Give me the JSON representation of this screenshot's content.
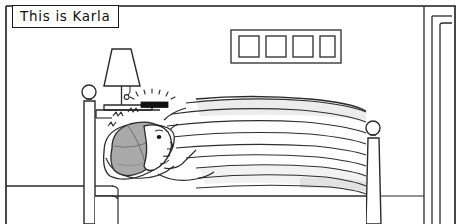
{
  "panel": {
    "caption": "This is Karla",
    "width": 461,
    "height": 224,
    "background_color": "#ffffff",
    "ink_color": "#1a1a1a",
    "style": "black-and-white line-art comic panel"
  },
  "scene": {
    "setting_label": "bedroom",
    "wall_art": {
      "label": "framed pictures",
      "outer_frame_count": 1,
      "inner_frame_count": 4
    },
    "doorway": {
      "label": "doorway",
      "edge_count": 3
    },
    "lamp": {
      "label": "table lamp",
      "shade_shape": "trapezoid",
      "has_pull_chain": true
    },
    "nightstand": {
      "label": "nightstand"
    },
    "alarm_clock": {
      "label": "alarm clock",
      "state": "ringing",
      "ray_count": 7,
      "body_color": "#111111"
    },
    "bed": {
      "label": "bed",
      "headboard_finial": "round",
      "footboard_finial": "round",
      "blanket_fold_count": 9
    },
    "character": {
      "name": "Karla",
      "pose": "lying awake in bed",
      "hair_color": "#a9a9a9",
      "pillow_color": "#fdfdfd",
      "startle_marks": 3
    }
  },
  "colors": {
    "ink": "#1a1a1a",
    "line_soft": "#3a3a3a",
    "hair_gray": "#a9a9a9",
    "hair_gray_dark": "#8d8d8d",
    "shadow_gray": "#d9d9d9",
    "shadow_light": "#ececec",
    "paper": "#ffffff"
  }
}
